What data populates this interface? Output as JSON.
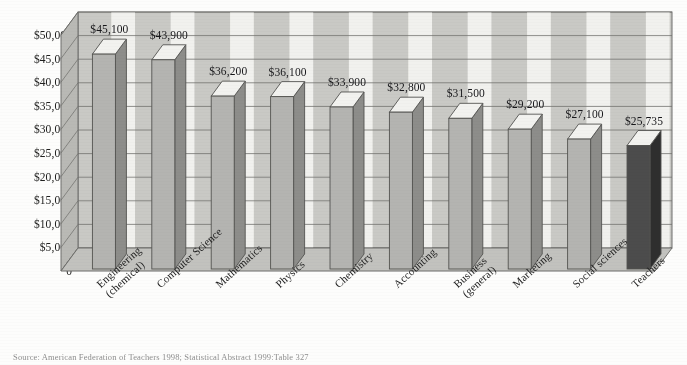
{
  "chart_data": {
    "type": "bar",
    "title": "",
    "subtitle": "",
    "xlabel": "",
    "ylabel": "",
    "categories": [
      "Engineering\n(chemical)",
      "Computer Science",
      "Mathematics",
      "Physics",
      "Chemistry",
      "Accounting",
      "Business\n(general)",
      "Marketing",
      "Social sciences",
      "Teachers"
    ],
    "values": [
      45100,
      43900,
      36200,
      36100,
      33900,
      32800,
      31500,
      29200,
      27100,
      25735
    ],
    "value_labels": [
      "$45,100",
      "$43,900",
      "$36,200",
      "$36,100",
      "$33,900",
      "$32,800",
      "$31,500",
      "$29,200",
      "$27,100",
      "$25,735"
    ],
    "ylim": [
      0,
      50000
    ],
    "ytick_values": [
      50000,
      45000,
      40000,
      35000,
      30000,
      25000,
      20000,
      15000,
      10000,
      5000,
      0
    ],
    "ytick_labels": [
      "$50,000",
      "$45,000",
      "$40,000",
      "$35,000",
      "$30,000",
      "$25,000",
      "$20,000",
      "$15,000",
      "$10,000",
      "$5,000",
      "0"
    ],
    "grid": true,
    "legend": false,
    "highlight_index": 9,
    "colors": {
      "bar_front": "#b4b4b1",
      "bar_side": "#8d8d8a",
      "bar_top": "#f2f2ef",
      "bar_highlight_front": "#4c4c4c",
      "bar_highlight_side": "#2e2e2e",
      "bar_highlight_top": "#f2f2ef",
      "wall_back": "#c9c9c5",
      "wall_band": "#f4f4f1",
      "wall_left": "#b9b9b5",
      "floor": "#c2c2be",
      "gridline": "#6f6f6c",
      "text": "#1b1b1b"
    }
  },
  "source": {
    "note": "Source: American Federation of Teachers 1998; Statistical Abstract 1999:Table 327"
  }
}
